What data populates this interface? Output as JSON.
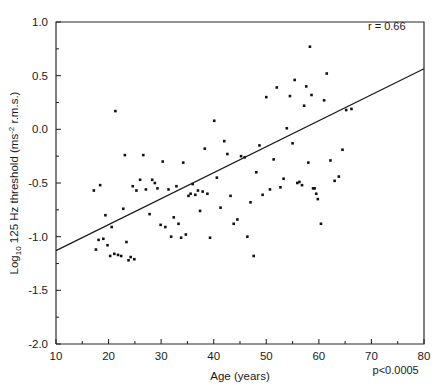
{
  "chart_data": {
    "type": "scatter",
    "title": "",
    "xlabel": "Age (years)",
    "ylabel": "Log10 125 Hz threshold (ms-2 r.m.s.)",
    "ylabel_parts": {
      "prefix": "Log",
      "subscript": "10",
      "mid": " 125 Hz threshold  (ms",
      "superscript": "-2",
      "suffix": " r.m.s.)"
    },
    "xlim": [
      10,
      80
    ],
    "ylim": [
      -2.0,
      1.0
    ],
    "xticks": [
      10,
      20,
      30,
      40,
      50,
      60,
      70,
      80
    ],
    "xtick_labels": [
      "10",
      "20",
      "30",
      "40",
      "50",
      "60",
      "70",
      "80"
    ],
    "xminor_ticks": [
      15,
      25,
      35,
      45,
      55,
      65,
      75
    ],
    "yticks": [
      -2.0,
      -1.5,
      -1.0,
      -0.5,
      0.0,
      0.5,
      1.0
    ],
    "ytick_labels": [
      "-2.0",
      "-1.5",
      "-1.0",
      "-0.5",
      "0.0",
      "0.5",
      "1.0"
    ],
    "yminor_ticks": [
      -1.75,
      -1.25,
      -0.75,
      -0.25,
      0.25,
      0.75
    ],
    "grid": false,
    "legend": null,
    "marker": "square",
    "marker_size": 2.6,
    "annotations": [
      {
        "name": "correlation",
        "text": "r = 0.66",
        "x": 76.5,
        "y": 0.93,
        "align": "end"
      },
      {
        "name": "significance",
        "text": "p<0.0005",
        "x": 79,
        "y": -2.28,
        "align": "end"
      }
    ],
    "regression_line": {
      "x0": 10,
      "y0": -1.13,
      "x1": 80,
      "y1": 0.565,
      "r": 0.66,
      "p": "<0.0005"
    },
    "points": [
      [
        17.2,
        -0.57
      ],
      [
        17.6,
        -1.12
      ],
      [
        18.1,
        -1.03
      ],
      [
        18.4,
        -0.52
      ],
      [
        19.0,
        -1.02
      ],
      [
        19.4,
        -0.8
      ],
      [
        19.8,
        -1.08
      ],
      [
        20.3,
        -1.18
      ],
      [
        20.6,
        -0.91
      ],
      [
        21.1,
        -1.16
      ],
      [
        21.3,
        0.17
      ],
      [
        21.8,
        -1.17
      ],
      [
        22.4,
        -1.18
      ],
      [
        22.8,
        -0.74
      ],
      [
        23.1,
        -0.24
      ],
      [
        23.4,
        -1.05
      ],
      [
        23.8,
        -1.22
      ],
      [
        24.2,
        -1.19
      ],
      [
        24.6,
        -0.53
      ],
      [
        24.9,
        -1.21
      ],
      [
        25.3,
        -0.57
      ],
      [
        26.0,
        -0.47
      ],
      [
        26.6,
        -0.24
      ],
      [
        27.1,
        -0.56
      ],
      [
        27.8,
        -0.79
      ],
      [
        28.3,
        -0.47
      ],
      [
        28.8,
        -0.5
      ],
      [
        29.3,
        -0.55
      ],
      [
        29.9,
        -0.89
      ],
      [
        30.3,
        -0.3
      ],
      [
        30.8,
        -0.91
      ],
      [
        31.4,
        -0.56
      ],
      [
        31.9,
        -1.0
      ],
      [
        32.4,
        -0.82
      ],
      [
        32.9,
        -0.53
      ],
      [
        33.3,
        -0.88
      ],
      [
        33.8,
        -1.01
      ],
      [
        34.2,
        -0.31
      ],
      [
        34.7,
        -0.98
      ],
      [
        35.2,
        -0.62
      ],
      [
        35.6,
        -0.6
      ],
      [
        36.0,
        -0.51
      ],
      [
        36.5,
        -0.61
      ],
      [
        37.0,
        -0.57
      ],
      [
        37.4,
        -0.76
      ],
      [
        37.9,
        -0.58
      ],
      [
        38.3,
        -0.18
      ],
      [
        38.8,
        -0.6
      ],
      [
        39.3,
        -1.01
      ],
      [
        40.1,
        0.08
      ],
      [
        40.6,
        -0.45
      ],
      [
        41.3,
        -0.73
      ],
      [
        42.0,
        -0.11
      ],
      [
        42.6,
        -0.23
      ],
      [
        43.2,
        -0.62
      ],
      [
        43.8,
        -0.88
      ],
      [
        44.5,
        -0.84
      ],
      [
        45.2,
        -0.25
      ],
      [
        45.9,
        -0.26
      ],
      [
        46.4,
        -1.0
      ],
      [
        47.0,
        -0.68
      ],
      [
        47.6,
        -1.18
      ],
      [
        48.1,
        -0.4
      ],
      [
        48.7,
        -0.15
      ],
      [
        49.3,
        -0.61
      ],
      [
        50.0,
        0.3
      ],
      [
        50.7,
        -0.56
      ],
      [
        51.4,
        -0.28
      ],
      [
        52.0,
        0.39
      ],
      [
        52.7,
        -0.54
      ],
      [
        53.3,
        -0.46
      ],
      [
        53.9,
        0.01
      ],
      [
        54.5,
        0.31
      ],
      [
        55.0,
        -0.13
      ],
      [
        55.4,
        0.46
      ],
      [
        55.9,
        -0.5
      ],
      [
        56.3,
        -0.49
      ],
      [
        56.8,
        -0.52
      ],
      [
        57.2,
        0.22
      ],
      [
        57.6,
        0.4
      ],
      [
        58.0,
        -0.31
      ],
      [
        58.3,
        0.77
      ],
      [
        58.6,
        0.32
      ],
      [
        58.9,
        -0.55
      ],
      [
        59.2,
        -0.55
      ],
      [
        59.5,
        -0.6
      ],
      [
        59.8,
        -0.65
      ],
      [
        60.4,
        -0.88
      ],
      [
        61.0,
        0.27
      ],
      [
        61.5,
        0.52
      ],
      [
        62.2,
        -0.29
      ],
      [
        63.0,
        -0.48
      ],
      [
        63.8,
        -0.44
      ],
      [
        64.5,
        -0.19
      ],
      [
        65.2,
        0.18
      ],
      [
        66.2,
        0.19
      ]
    ]
  }
}
